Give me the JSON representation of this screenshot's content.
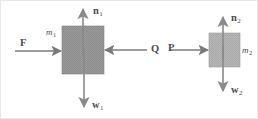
{
  "figure": {
    "background_color": "#ffffff",
    "stroke_color": "#6e6e6e",
    "block_fill_color": "#9a9a9a",
    "block_fill_color_2": "#b4b4b4",
    "label_color": "#4a4a4a"
  },
  "bodies": [
    {
      "id": "block-1",
      "mass_label": "m",
      "mass_subscript": "1",
      "fill": "#9a9a9a"
    },
    {
      "id": "block-2",
      "mass_label": "m",
      "mass_subscript": "2",
      "fill": "#b4b4b4"
    }
  ],
  "forces": [
    {
      "id": "force-F",
      "symbol": "F",
      "subscript": "",
      "direction": "right",
      "body": "block-1"
    },
    {
      "id": "force-Q",
      "symbol": "Q",
      "subscript": "",
      "direction": "left",
      "body": "block-1"
    },
    {
      "id": "force-n1",
      "symbol": "n",
      "subscript": "1",
      "direction": "up",
      "body": "block-1"
    },
    {
      "id": "force-w1",
      "symbol": "w",
      "subscript": "1",
      "direction": "down",
      "body": "block-1"
    },
    {
      "id": "force-P",
      "symbol": "P",
      "subscript": "",
      "direction": "right",
      "body": "block-2"
    },
    {
      "id": "force-n2",
      "symbol": "n",
      "subscript": "2",
      "direction": "up",
      "body": "block-2"
    },
    {
      "id": "force-w2",
      "symbol": "w",
      "subscript": "2",
      "direction": "down",
      "body": "block-2"
    }
  ]
}
